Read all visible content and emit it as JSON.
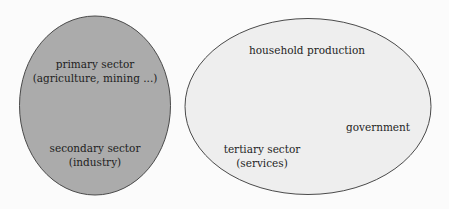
{
  "diagram": {
    "colors": {
      "background": "#fbfbfb",
      "left_fill": "#ababab",
      "right_fill": "#eeeeee",
      "stroke": "#4a4a4a",
      "text": "#1e1e1e"
    },
    "left_ellipse": {
      "lines": [
        "primary sector",
        "(agriculture, mining ...)",
        "secondary sector",
        "(industry)"
      ]
    },
    "right_ellipse": {
      "household": "household production",
      "government": "government",
      "tertiary": [
        "tertiary sector",
        "(services)"
      ]
    }
  }
}
